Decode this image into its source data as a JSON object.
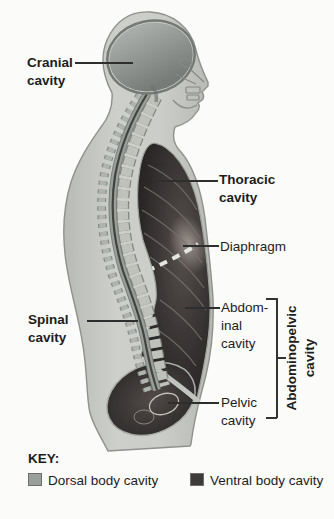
{
  "diagram": {
    "title_implicit": "Body cavities, lateral view",
    "labels": {
      "cranial": "Cranial\ncavity",
      "thoracic": "Thoracic\ncavity",
      "diaphragm": "Diaphragm",
      "spinal": "Spinal\ncavity",
      "abdominal": "Abdom-\ninal\ncavity",
      "pelvic": "Pelvic\ncavity",
      "abdominopelvic": "Abdominopelvic\ncavity"
    }
  },
  "key": {
    "title": "KEY:",
    "items": [
      {
        "name": "dorsal",
        "label": "Dorsal body cavity",
        "color": "#99a09b"
      },
      {
        "name": "ventral",
        "label": "Ventral body cavity",
        "color": "#3d3a3a"
      }
    ]
  },
  "colors": {
    "dorsal_cavity": "#99a09b",
    "ventral_cavity": "#3d3a3a",
    "body_silhouette": "#c7c9c5",
    "background": "#fbfbf9",
    "leader_line": "#2e2e2e",
    "text": "#1c1c1c"
  }
}
